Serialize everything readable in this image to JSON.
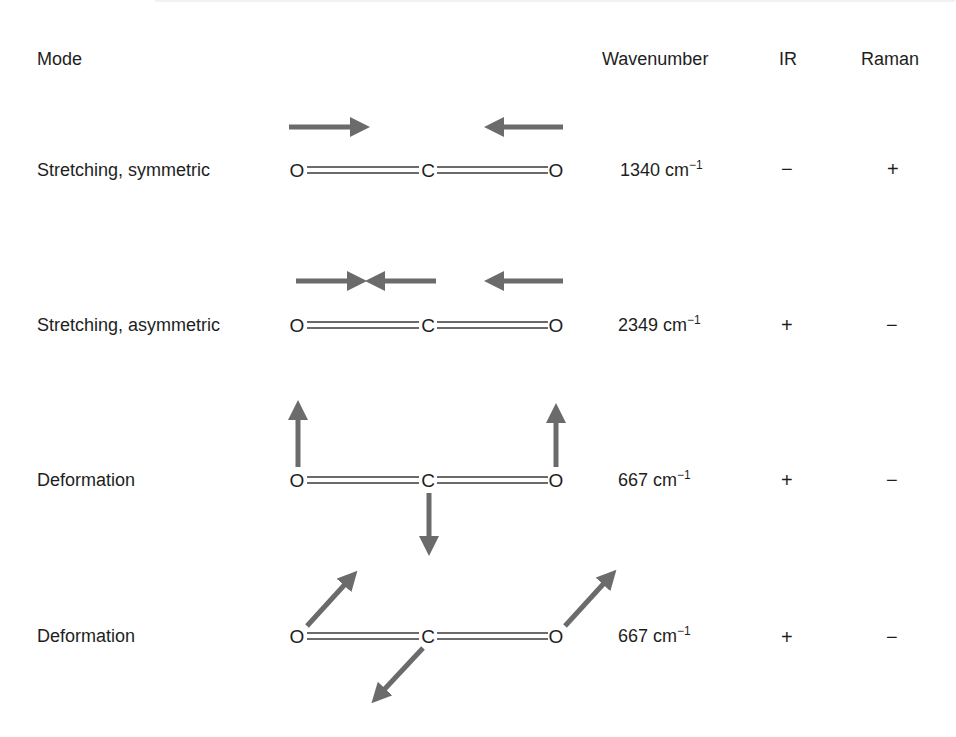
{
  "header": {
    "mode": "Mode",
    "wavenumber": "Wavenumber",
    "ir": "IR",
    "raman": "Raman"
  },
  "molecule": {
    "left_atom": "O",
    "center_atom": "C",
    "right_atom": "O"
  },
  "colors": {
    "arrow": "#6b6b6b",
    "bond": "#3a3a3a",
    "text": "#1e1e1e"
  },
  "rows": [
    {
      "mode": "Stretching, symmetric",
      "wavenumber_value": "1340",
      "wavenumber_unit": "cm",
      "wavenumber_exp": "−1",
      "ir": "−",
      "raman": "+",
      "arrows": [
        "O-left: right",
        "C: none",
        "O-right: left"
      ]
    },
    {
      "mode": "Stretching, asymmetric",
      "wavenumber_value": "2349",
      "wavenumber_unit": "cm",
      "wavenumber_exp": "−1",
      "ir": "+",
      "raman": "−",
      "arrows": [
        "O-left: right",
        "C: left",
        "O-right: left"
      ]
    },
    {
      "mode": "Deformation",
      "wavenumber_value": "667",
      "wavenumber_unit": "cm",
      "wavenumber_exp": "−1",
      "ir": "+",
      "raman": "−",
      "arrows": [
        "O-left: up",
        "C: down",
        "O-right: up"
      ]
    },
    {
      "mode": "Deformation",
      "wavenumber_value": "667",
      "wavenumber_unit": "cm",
      "wavenumber_exp": "−1",
      "ir": "+",
      "raman": "−",
      "arrows": [
        "O-left: up-right",
        "C: down-left",
        "O-right: up-right"
      ]
    }
  ]
}
